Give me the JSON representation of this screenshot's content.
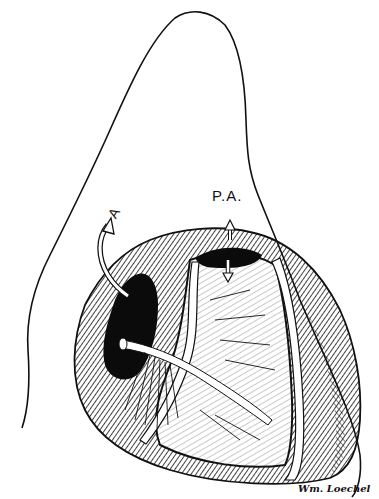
{
  "figure": {
    "type": "anatomical-illustration",
    "style": "black-and-white pen-and-ink hatching",
    "colors": {
      "ink": "#111111",
      "paper": "#ffffff"
    }
  },
  "labels": {
    "aorta": "A",
    "pulmonary_artery": "P.A."
  },
  "signature": "Wm. Loechel"
}
